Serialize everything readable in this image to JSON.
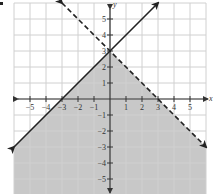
{
  "chart_data": {
    "type": "line",
    "title": "",
    "xlabel": "x",
    "ylabel": "y",
    "xlim": [
      -6,
      6
    ],
    "ylim": [
      -6,
      6
    ],
    "grid": true,
    "x_ticks": [
      -5,
      -4,
      -3,
      -2,
      -1,
      1,
      2,
      3,
      4,
      5
    ],
    "y_ticks": [
      -5,
      -4,
      -3,
      -2,
      -1,
      1,
      2,
      3,
      4,
      5
    ],
    "series": [
      {
        "name": "y = x + 3",
        "style": "solid",
        "points": [
          [
            -6,
            -3
          ],
          [
            3,
            6
          ]
        ],
        "arrows": "both"
      },
      {
        "name": "y = -x + 3",
        "style": "dashed",
        "points": [
          [
            -3,
            6
          ],
          [
            6,
            -3
          ]
        ],
        "arrows": "both"
      }
    ],
    "shaded_region": {
      "description": "below both lines (y <= x + 3 and y < -x + 3)",
      "vertices": [
        [
          -6,
          -6
        ],
        [
          -6,
          -3
        ],
        [
          0,
          3
        ],
        [
          6,
          -3
        ],
        [
          6,
          -6
        ]
      ],
      "color": "#c8c8c8"
    }
  },
  "colors": {
    "grid": "#d0d0d0",
    "axis": "#333333",
    "line": "#222222",
    "shade": "#c8c8c8"
  },
  "axis_labels": {
    "x": "x",
    "y": "y"
  }
}
